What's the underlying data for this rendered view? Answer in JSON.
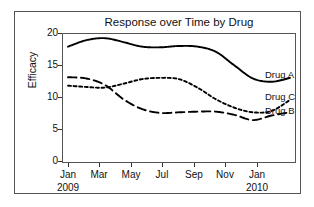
{
  "figure": {
    "title": "Response over Time by Drug",
    "ylabel": "Efficacy"
  },
  "axes": {
    "yticks": [
      "20",
      "15",
      "10",
      "5",
      "0"
    ],
    "xticks": [
      "Jan",
      "Mar",
      "May",
      "Jul",
      "Sep",
      "Nov",
      "Jan"
    ],
    "xyears": [
      "2009",
      "",
      "",
      "",
      "",
      "",
      "2010"
    ]
  },
  "series_labels": {
    "a": "Drug A",
    "c": "Drug C",
    "b": "Drug B"
  },
  "chart_data": {
    "type": "line",
    "title": "Response over Time by Drug",
    "xlabel": "",
    "ylabel": "Efficacy",
    "xlim": [
      0,
      12
    ],
    "ylim": [
      0,
      20
    ],
    "grid": false,
    "legend": "inline-right",
    "x": [
      "Jan 2009",
      "Feb 2009",
      "Mar 2009",
      "Apr 2009",
      "May 2009",
      "Jun 2009",
      "Jul 2009",
      "Aug 2009",
      "Sep 2009",
      "Oct 2009",
      "Nov 2009",
      "Dec 2009",
      "Jan 2010"
    ],
    "xtick_labels": [
      "Jan 2009",
      "Mar",
      "May",
      "Jul",
      "Sep",
      "Nov",
      "Jan 2010"
    ],
    "series": [
      {
        "name": "Drug A",
        "style": "solid",
        "color": "#000000",
        "values": [
          17.9,
          18.9,
          19.2,
          18.6,
          17.9,
          17.8,
          18.0,
          17.9,
          17.1,
          15.0,
          13.0,
          12.5,
          13.1
        ]
      },
      {
        "name": "Drug C",
        "style": "dotted",
        "color": "#000000",
        "values": [
          11.9,
          11.7,
          11.6,
          12.2,
          12.9,
          13.1,
          12.9,
          11.6,
          9.8,
          8.5,
          7.8,
          8.0,
          9.7
        ]
      },
      {
        "name": "Drug B",
        "style": "dashed",
        "color": "#000000",
        "values": [
          13.2,
          13.0,
          12.0,
          9.8,
          8.3,
          7.7,
          7.8,
          7.9,
          7.9,
          7.4,
          6.6,
          7.3,
          7.8
        ]
      }
    ]
  }
}
